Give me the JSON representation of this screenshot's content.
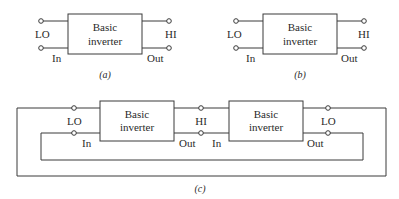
{
  "diagrams": {
    "a": {
      "caption": "(a)",
      "box_line1": "Basic",
      "box_line2": "inverter",
      "left_top_label": "LO",
      "left_bottom_label": "In",
      "right_top_label": "HI",
      "right_bottom_label": "Out"
    },
    "b": {
      "caption": "(b)",
      "box_line1": "Basic",
      "box_line2": "inverter",
      "left_top_label": "LO",
      "left_bottom_label": "In",
      "right_top_label": "HI",
      "right_bottom_label": "Out"
    },
    "c": {
      "caption": "(c)",
      "inverter1": {
        "box_line1": "Basic",
        "box_line2": "inverter",
        "left_top_label": "LO",
        "left_bottom_label": "In",
        "right_bottom_label": "Out"
      },
      "middle_label": "HI",
      "inverter2": {
        "box_line1": "Basic",
        "box_line2": "inverter",
        "left_bottom_label": "In",
        "right_top_label": "LO",
        "right_bottom_label": "Out"
      }
    }
  },
  "colors": {
    "line": "#3a3a3a",
    "text": "#2a2a2a",
    "background": "#ffffff"
  }
}
